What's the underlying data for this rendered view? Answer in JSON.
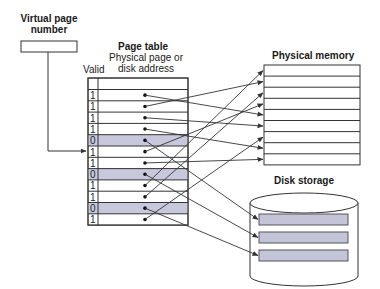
{
  "labels": {
    "vpn_line1": "Virtual page",
    "vpn_line2": "number",
    "page_table_title": "Page table",
    "phys_col_line1": "Physical page or",
    "phys_col_line2": "disk address",
    "valid_col": "Valid",
    "physical_memory": "Physical memory",
    "disk_storage": "Disk storage"
  },
  "colors": {
    "invalid_row_fill": "#c8c8dc",
    "disk_block_fill": "#c4c4d8",
    "line": "#333333"
  },
  "page_table": {
    "rows": [
      {
        "valid": "1",
        "target": "mem",
        "index": 4
      },
      {
        "valid": "1",
        "target": "mem",
        "index": 1
      },
      {
        "valid": "1",
        "target": "mem",
        "index": 5
      },
      {
        "valid": "1",
        "target": "mem",
        "index": 7
      },
      {
        "valid": "0",
        "target": "disk",
        "index": 0
      },
      {
        "valid": "1",
        "target": "mem",
        "index": 3
      },
      {
        "valid": "1",
        "target": "mem",
        "index": 8
      },
      {
        "valid": "0",
        "target": "disk",
        "index": 1
      },
      {
        "valid": "1",
        "target": "mem",
        "index": 0
      },
      {
        "valid": "1",
        "target": "mem",
        "index": 2
      },
      {
        "valid": "0",
        "target": "disk",
        "index": 2
      },
      {
        "valid": "1",
        "target": "mem",
        "index": 6
      }
    ]
  },
  "physical_memory": {
    "rows": 9
  },
  "disk_storage": {
    "blocks": 3
  }
}
